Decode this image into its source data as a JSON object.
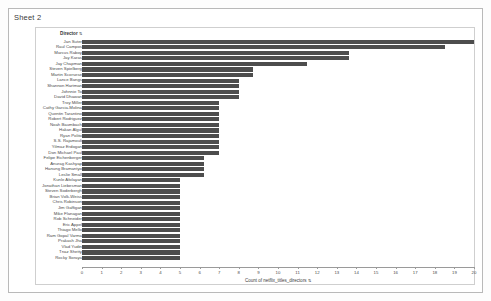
{
  "window": {
    "sheet_title": "Sheet 2"
  },
  "chart_header": {
    "dimension_label": "Director",
    "sort_glyph": "⇅"
  },
  "axis": {
    "title": "Count of netflix_titles_directors",
    "sort_glyph": "⇅",
    "ticks": [
      "0",
      "1",
      "2",
      "3",
      "4",
      "5",
      "6",
      "7",
      "8",
      "9",
      "10",
      "11",
      "12",
      "13",
      "14",
      "15",
      "16",
      "17",
      "18",
      "19",
      "20"
    ],
    "min": 0,
    "max": 20
  },
  "colors": {
    "bar": "#4d4d4d",
    "axis": "#9a9a9a",
    "frame": "#b9b9b9",
    "card_border": "#cfcfcf",
    "text": "#4a4a4a"
  },
  "chart_data": {
    "type": "bar",
    "orientation": "horizontal",
    "title": "Sheet 2",
    "xlabel": "Count of netflix_titles_directors",
    "ylabel": "Director",
    "xlim": [
      0,
      20
    ],
    "grid": false,
    "legend": "none",
    "categories": [
      "Jan Suter",
      "Raul Campos",
      "Marcus Raboy",
      "Jay Karas",
      "Jay Chapman",
      "Steven Spielberg",
      "Martin Scorsese",
      "Lance Bangs",
      "Shannon Hartman",
      "Johnnie To",
      "David Dhawan",
      "Troy Miller",
      "Cathy Garcia-Molina",
      "Quentin Tarantino",
      "Robert Rodriguez",
      "Noah Baumbach",
      "Hakan Algul",
      "Ryan Polito",
      "S.S. Rajamouli",
      "Yilmaz Erdogan",
      "Don Michael Paul",
      "Felipe Eichenberger",
      "Anurag Kashyap",
      "Hanung Bramantyo",
      "Leslie Small",
      "Kunle Afolayan",
      "Jonathan Liebesman",
      "Steven Soderbergh",
      "Brian Volk-Weiss",
      "Chris Robinson",
      "Jim Gaffigan",
      "Mike Flanagan",
      "Rob Schneider",
      "Eric Appel",
      "Thiago Mello",
      "Ram Gopal Varma",
      "Prakash Jha",
      "Vlad Yudin",
      "Tnaz Shetty",
      "Rocky Soraya"
    ],
    "values": [
      20.0,
      18.5,
      13.6,
      13.6,
      11.5,
      8.7,
      8.7,
      8.0,
      8.0,
      8.0,
      8.0,
      7.0,
      7.0,
      7.0,
      7.0,
      7.0,
      7.0,
      7.0,
      7.0,
      7.0,
      7.0,
      6.2,
      6.2,
      6.2,
      6.2,
      5.0,
      5.0,
      5.0,
      5.0,
      5.0,
      5.0,
      5.0,
      5.0,
      5.0,
      5.0,
      5.0,
      5.0,
      5.0,
      5.0,
      5.0
    ]
  }
}
